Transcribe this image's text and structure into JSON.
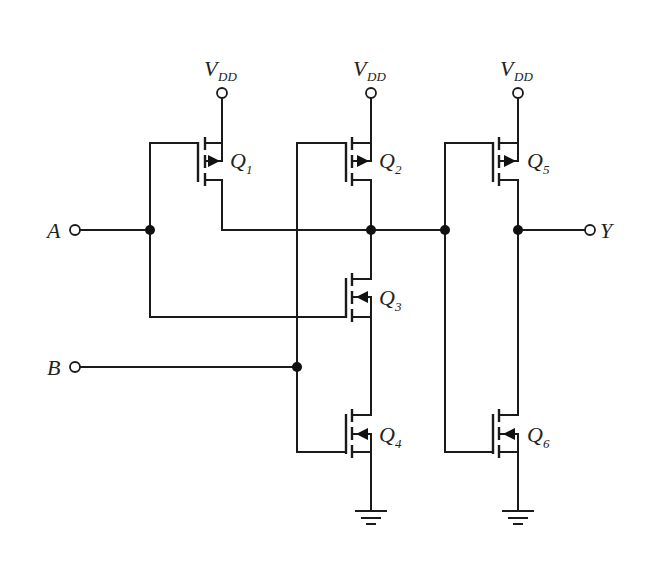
{
  "diagram": {
    "type": "CMOS logic gate schematic",
    "supply_label": "V",
    "supply_subscript": "DD",
    "inputs": [
      {
        "name": "A"
      },
      {
        "name": "B"
      }
    ],
    "output": {
      "name": "Y"
    },
    "transistors": [
      {
        "id": "Q",
        "sub": "1",
        "type": "PMOS"
      },
      {
        "id": "Q",
        "sub": "2",
        "type": "PMOS"
      },
      {
        "id": "Q",
        "sub": "3",
        "type": "NMOS"
      },
      {
        "id": "Q",
        "sub": "4",
        "type": "NMOS"
      },
      {
        "id": "Q",
        "sub": "5",
        "type": "PMOS"
      },
      {
        "id": "Q",
        "sub": "6",
        "type": "NMOS"
      }
    ],
    "colors": {
      "wire": "#1a1a1a",
      "background": "#ffffff"
    }
  }
}
